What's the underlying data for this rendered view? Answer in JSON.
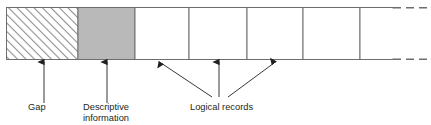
{
  "figure": {
    "colors": {
      "outline": "#6e6e72",
      "hatch_line": "#8d8d92",
      "descriptive_fill": "#b9b9b9",
      "record_fill": "#ffffff",
      "text": "#231f20",
      "arrow": "#231f20",
      "leader": "#58585b"
    },
    "blocks": [
      {
        "name": "gap",
        "fill": "hatched",
        "x": 6,
        "width": 72
      },
      {
        "name": "descriptive-information",
        "fill": "solid-gray",
        "x": 78,
        "width": 57
      },
      {
        "name": "logical-record-1",
        "fill": "white",
        "x": 135,
        "width": 54
      },
      {
        "name": "logical-record-2",
        "fill": "white",
        "x": 189,
        "width": 58
      },
      {
        "name": "logical-record-3",
        "fill": "white",
        "x": 247,
        "width": 56
      },
      {
        "name": "logical-record-4",
        "fill": "white",
        "x": 303,
        "width": 57
      },
      {
        "name": "logical-record-5",
        "fill": "white",
        "x": 360,
        "width": 33
      }
    ],
    "continuation": {
      "style": "dashed",
      "x_start": 393,
      "x_end": 429
    },
    "labels": [
      {
        "id": "gap",
        "text": "Gap",
        "lines": [
          "Gap"
        ]
      },
      {
        "id": "descriptive-information",
        "text": "Descriptive information",
        "lines": [
          "Descriptive",
          "information"
        ]
      },
      {
        "id": "logical-records",
        "text": "Logical records",
        "lines": [
          "Logical records"
        ]
      }
    ],
    "arrows": [
      {
        "name": "arrow-to-gap",
        "target_x": 44,
        "kind": "vertical"
      },
      {
        "name": "arrow-to-descriptive-information",
        "target_x": 107,
        "kind": "vertical"
      },
      {
        "name": "arrow-to-record-1",
        "target_x": 161,
        "kind": "slanted-left"
      },
      {
        "name": "arrow-to-record-2",
        "target_x": 219,
        "kind": "vertical"
      },
      {
        "name": "arrow-to-record-3",
        "target_x": 274,
        "kind": "slanted-right"
      }
    ]
  }
}
